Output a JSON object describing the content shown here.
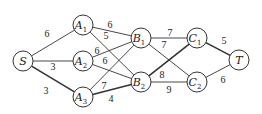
{
  "diagram": {
    "type": "weighted-graph",
    "nodes": [
      {
        "id": "S",
        "label": "S",
        "sub": "",
        "x": 23,
        "y": 61
      },
      {
        "id": "A1",
        "label": "A",
        "sub": "1",
        "x": 83,
        "y": 25
      },
      {
        "id": "A2",
        "label": "A",
        "sub": "2",
        "x": 83,
        "y": 61
      },
      {
        "id": "A3",
        "label": "A",
        "sub": "3",
        "x": 83,
        "y": 97
      },
      {
        "id": "B1",
        "label": "B",
        "sub": "1",
        "x": 141,
        "y": 38
      },
      {
        "id": "B2",
        "label": "B",
        "sub": "2",
        "x": 141,
        "y": 82
      },
      {
        "id": "C1",
        "label": "C",
        "sub": "1",
        "x": 197,
        "y": 38
      },
      {
        "id": "C2",
        "label": "C",
        "sub": "2",
        "x": 197,
        "y": 82
      },
      {
        "id": "T",
        "label": "T",
        "sub": "",
        "x": 239,
        "y": 60
      }
    ],
    "edges": [
      {
        "from": "S",
        "to": "A1",
        "weight": "6",
        "lx": 47,
        "ly": 37,
        "bold": false
      },
      {
        "from": "S",
        "to": "A2",
        "weight": "3",
        "lx": 53,
        "ly": 70,
        "bold": false
      },
      {
        "from": "S",
        "to": "A3",
        "weight": "3",
        "lx": 46,
        "ly": 94,
        "bold": true
      },
      {
        "from": "A1",
        "to": "B1",
        "weight": "6",
        "lx": 110,
        "ly": 28,
        "bold": false
      },
      {
        "from": "A1",
        "to": "B2",
        "weight": "5",
        "lx": 106,
        "ly": 39,
        "bold": false
      },
      {
        "from": "A2",
        "to": "B1",
        "weight": "6",
        "lx": 97,
        "ly": 54,
        "bold": false
      },
      {
        "from": "A2",
        "to": "B2",
        "weight": "6",
        "lx": 105,
        "ly": 64,
        "bold": false
      },
      {
        "from": "A3",
        "to": "B1",
        "weight": "7",
        "lx": 104,
        "ly": 89,
        "bold": false
      },
      {
        "from": "A3",
        "to": "B2",
        "weight": "4",
        "lx": 111,
        "ly": 102,
        "bold": true
      },
      {
        "from": "B1",
        "to": "C1",
        "weight": "7",
        "lx": 170,
        "ly": 36,
        "bold": false
      },
      {
        "from": "B1",
        "to": "C2",
        "weight": "7",
        "lx": 164,
        "ly": 48,
        "bold": false
      },
      {
        "from": "B2",
        "to": "C1",
        "weight": "8",
        "lx": 162,
        "ly": 78,
        "bold": true
      },
      {
        "from": "B2",
        "to": "C2",
        "weight": "9",
        "lx": 169,
        "ly": 93,
        "bold": false
      },
      {
        "from": "C1",
        "to": "T",
        "weight": "5",
        "lx": 224,
        "ly": 44,
        "bold": true
      },
      {
        "from": "C2",
        "to": "T",
        "weight": "6",
        "lx": 223,
        "ly": 83,
        "bold": false
      }
    ]
  }
}
